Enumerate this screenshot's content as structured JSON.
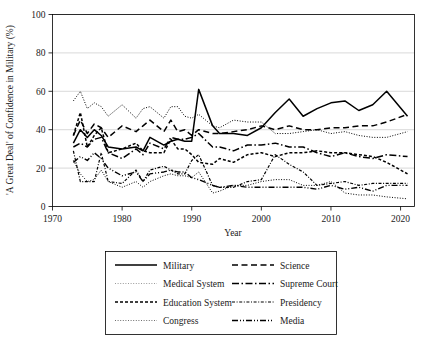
{
  "chart_data": {
    "type": "line",
    "title": "",
    "xlabel": "Year",
    "ylabel": "'A Great Deal' of Confidence in Military (%)",
    "xlim": [
      1970,
      2022
    ],
    "ylim": [
      0,
      100
    ],
    "xticks": [
      1970,
      1980,
      1990,
      2000,
      2010,
      2020
    ],
    "yticks": [
      0,
      20,
      40,
      60,
      80,
      100
    ],
    "grid": true,
    "legend_position": "below-center",
    "x": [
      1973,
      1974,
      1975,
      1976,
      1977,
      1978,
      1980,
      1982,
      1983,
      1984,
      1986,
      1987,
      1988,
      1989,
      1990,
      1991,
      1993,
      1994,
      1996,
      1998,
      2000,
      2002,
      2004,
      2006,
      2008,
      2010,
      2012,
      2014,
      2016,
      2018,
      2021
    ],
    "series": [
      {
        "name": "Military",
        "style": "solid",
        "values": [
          33,
          40,
          36,
          40,
          37,
          31,
          30,
          31,
          29,
          36,
          32,
          34,
          35,
          34,
          34,
          61,
          42,
          38,
          38,
          37,
          41,
          49,
          56,
          47,
          51,
          54,
          55,
          50,
          53,
          60,
          47
        ]
      },
      {
        "name": "Medical System",
        "style": "fine-dotted-light",
        "values": [
          55,
          60,
          51,
          54,
          52,
          47,
          53,
          46,
          51,
          52,
          46,
          52,
          52,
          47,
          46,
          48,
          42,
          41,
          45,
          44,
          44,
          38,
          38,
          39,
          40,
          38,
          39,
          37,
          36,
          36,
          39
        ]
      },
      {
        "name": "Education System",
        "style": "dashed-bold",
        "values": [
          37,
          49,
          31,
          37,
          41,
          28,
          30,
          33,
          29,
          28,
          28,
          35,
          30,
          30,
          27,
          23,
          22,
          25,
          23,
          27,
          28,
          26,
          28,
          28,
          29,
          28,
          28,
          27,
          26,
          23,
          17
        ]
      },
      {
        "name": "Congress",
        "style": "fine-dotted",
        "values": [
          24,
          17,
          13,
          14,
          19,
          13,
          10,
          13,
          10,
          13,
          16,
          17,
          16,
          16,
          15,
          18,
          7,
          8,
          11,
          11,
          13,
          14,
          14,
          11,
          11,
          13,
          7,
          6,
          6,
          5,
          4
        ]
      },
      {
        "name": "Science",
        "style": "dashed",
        "values": [
          37,
          45,
          38,
          43,
          41,
          36,
          42,
          39,
          42,
          45,
          39,
          45,
          39,
          40,
          37,
          40,
          38,
          38,
          39,
          40,
          42,
          40,
          42,
          40,
          40,
          41,
          41,
          42,
          42,
          44,
          48
        ]
      },
      {
        "name": "Supreme Court",
        "style": "dash-dot",
        "values": [
          31,
          33,
          31,
          35,
          36,
          28,
          25,
          30,
          27,
          33,
          30,
          36,
          35,
          35,
          36,
          38,
          31,
          31,
          29,
          32,
          32,
          33,
          31,
          31,
          28,
          26,
          28,
          26,
          25,
          27,
          26
        ]
      },
      {
        "name": "Presidency",
        "style": "dash-dot-dot-fine",
        "values": [
          29,
          13,
          13,
          13,
          28,
          13,
          12,
          19,
          13,
          19,
          21,
          19,
          17,
          17,
          24,
          27,
          11,
          10,
          10,
          13,
          14,
          27,
          22,
          18,
          11,
          12,
          13,
          11,
          12,
          12,
          12
        ]
      },
      {
        "name": "Media",
        "style": "long-dash-dot-dot",
        "values": [
          23,
          26,
          24,
          28,
          25,
          20,
          16,
          18,
          13,
          17,
          18,
          19,
          18,
          18,
          15,
          14,
          11,
          10,
          11,
          10,
          10,
          10,
          10,
          10,
          9,
          11,
          9,
          10,
          8,
          11,
          11
        ]
      }
    ],
    "legend_entries": [
      {
        "label": "Military",
        "style": "solid",
        "column": "left"
      },
      {
        "label": "Medical System",
        "style": "fine-dotted-light",
        "column": "left"
      },
      {
        "label": "Education System",
        "style": "dashed-bold",
        "column": "left"
      },
      {
        "label": "Congress",
        "style": "fine-dotted",
        "column": "left"
      },
      {
        "label": "Science",
        "style": "dashed",
        "column": "right"
      },
      {
        "label": "Supreme Court",
        "style": "dash-dot",
        "column": "right"
      },
      {
        "label": "Presidency",
        "style": "dash-dot-dot-fine",
        "column": "right"
      },
      {
        "label": "Media",
        "style": "long-dash-dot-dot",
        "column": "right"
      }
    ]
  },
  "colors": {
    "line": "#000000",
    "grid": "#c9c9c9",
    "background": "#ffffff",
    "light_line": "#9a9a9a"
  }
}
